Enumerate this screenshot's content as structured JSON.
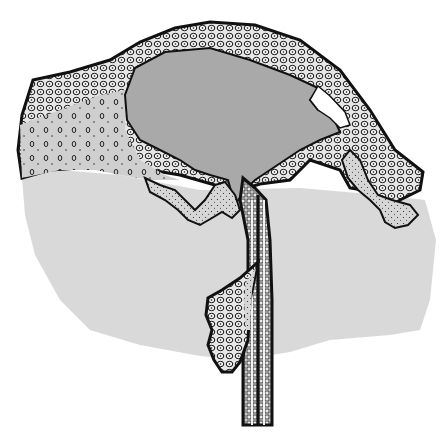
{
  "figure": {
    "colors": {
      "background": "#ffffff",
      "dermis": "#d9d9d9",
      "cyst_fill": "#a9a9a9",
      "tissue_light": "#c8c8c8",
      "ink": "#111111",
      "cell_fill": "#e8e8e8",
      "cavity": "#ffffff"
    },
    "parts": [
      "epidermis-surface-layer",
      "cellular-layer",
      "cyst-cavity",
      "air-gap",
      "dermis-background",
      "follicle-duct",
      "sebaceous-gland"
    ]
  }
}
